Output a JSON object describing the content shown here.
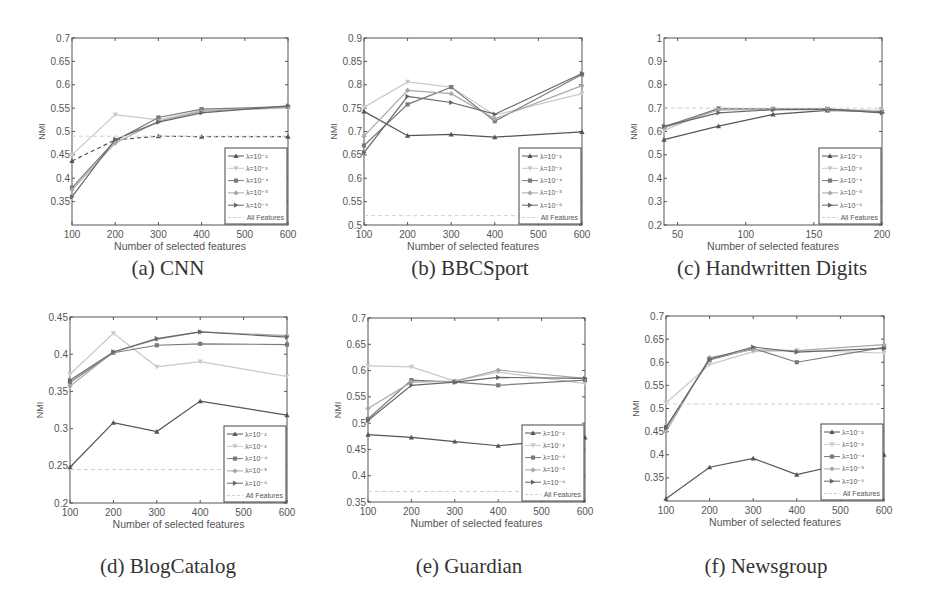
{
  "figure": {
    "captions": [
      "(a) CNN",
      "(b) BBCSport",
      "(c) Handwritten Digits",
      "(d) BlogCatalog",
      "(e) Guardian",
      "(f) Newsgroup"
    ]
  },
  "legend": {
    "entries": [
      "λ=10⁻²",
      "λ=10⁻³",
      "λ=10⁻⁴",
      "λ=10⁻⁵",
      "λ=10⁻⁶",
      "All Features"
    ],
    "colors": [
      "#555555",
      "#c8c8c8",
      "#7a7a7a",
      "#a8a8a8",
      "#666666",
      "#d0d0d0"
    ],
    "markers": [
      "triangle",
      "triangle-down",
      "square",
      "diamond",
      "triangle-right",
      "none"
    ]
  },
  "chart_data": [
    {
      "type": "line",
      "title": "(a) CNN",
      "xlabel": "Number of selected features",
      "ylabel": "NMI",
      "x": [
        100,
        200,
        300,
        400,
        600
      ],
      "xticks": [
        100,
        200,
        300,
        400,
        500,
        600
      ],
      "xlim": [
        100,
        600
      ],
      "ylim": [
        0.3,
        0.7
      ],
      "yticks": [
        0.35,
        0.4,
        0.45,
        0.5,
        0.55,
        0.6,
        0.65,
        0.7
      ],
      "grid": false,
      "legend_position": "lower right",
      "series": [
        {
          "name": "λ=10⁻²",
          "values": [
            0.437,
            0.482,
            0.49,
            0.489,
            0.489
          ]
        },
        {
          "name": "λ=10⁻³",
          "values": [
            0.45,
            0.536,
            0.525,
            0.545,
            0.55
          ]
        },
        {
          "name": "λ=10⁻⁴",
          "values": [
            0.38,
            0.48,
            0.53,
            0.548,
            0.553
          ]
        },
        {
          "name": "λ=10⁻⁵",
          "values": [
            0.375,
            0.475,
            0.522,
            0.543,
            0.552
          ]
        },
        {
          "name": "λ=10⁻⁶",
          "values": [
            0.36,
            0.483,
            0.52,
            0.54,
            0.555
          ]
        },
        {
          "name": "All Features",
          "values": [
            0.49,
            0.49,
            0.49,
            0.49,
            0.49
          ]
        }
      ]
    },
    {
      "type": "line",
      "title": "(b) BBCSport",
      "xlabel": "Number of selected features",
      "ylabel": "NMI",
      "x": [
        100,
        200,
        300,
        400,
        600
      ],
      "xticks": [
        100,
        200,
        300,
        400,
        500,
        600
      ],
      "xlim": [
        100,
        600
      ],
      "ylim": [
        0.5,
        0.9
      ],
      "yticks": [
        0.5,
        0.55,
        0.6,
        0.65,
        0.7,
        0.75,
        0.8,
        0.85,
        0.9
      ],
      "grid": false,
      "legend_position": "lower right",
      "series": [
        {
          "name": "λ=10⁻²",
          "values": [
            0.743,
            0.691,
            0.694,
            0.688,
            0.699
          ]
        },
        {
          "name": "λ=10⁻³",
          "values": [
            0.752,
            0.806,
            0.795,
            0.735,
            0.781
          ]
        },
        {
          "name": "λ=10⁻⁴",
          "values": [
            0.67,
            0.758,
            0.795,
            0.722,
            0.822
          ]
        },
        {
          "name": "λ=10⁻⁵",
          "values": [
            0.69,
            0.788,
            0.781,
            0.727,
            0.798
          ]
        },
        {
          "name": "λ=10⁻⁶",
          "values": [
            0.655,
            0.775,
            0.762,
            0.737,
            0.824
          ]
        },
        {
          "name": "All Features",
          "values": [
            0.52,
            0.52,
            0.52,
            0.52,
            0.52
          ]
        }
      ]
    },
    {
      "type": "line",
      "title": "(c) Handwritten Digits",
      "xlabel": "Number of selected features",
      "ylabel": "NMI",
      "x": [
        40,
        80,
        120,
        160,
        200
      ],
      "xticks": [
        50,
        100,
        150,
        200
      ],
      "xlim": [
        40,
        200
      ],
      "ylim": [
        0.2,
        1.0
      ],
      "yticks": [
        0.2,
        0.3,
        0.4,
        0.5,
        0.6,
        0.7,
        0.8,
        0.9,
        1
      ],
      "grid": false,
      "legend_position": "lower right",
      "series": [
        {
          "name": "λ=10⁻²",
          "values": [
            0.565,
            0.623,
            0.673,
            0.69,
            0.685
          ]
        },
        {
          "name": "λ=10⁻³",
          "values": [
            0.605,
            0.7,
            0.695,
            0.694,
            0.69
          ]
        },
        {
          "name": "λ=10⁻⁴",
          "values": [
            0.62,
            0.698,
            0.697,
            0.697,
            0.683
          ]
        },
        {
          "name": "λ=10⁻⁵",
          "values": [
            0.615,
            0.692,
            0.694,
            0.695,
            0.681
          ]
        },
        {
          "name": "λ=10⁻⁶",
          "values": [
            0.622,
            0.68,
            0.693,
            0.696,
            0.68
          ]
        },
        {
          "name": "All Features",
          "values": [
            0.7,
            0.7,
            0.7,
            0.7,
            0.7
          ]
        }
      ]
    },
    {
      "type": "line",
      "title": "(d) BlogCatalog",
      "xlabel": "Number of selected features",
      "ylabel": "NMI",
      "x": [
        100,
        200,
        300,
        400,
        600
      ],
      "xticks": [
        100,
        200,
        300,
        400,
        500,
        600
      ],
      "xlim": [
        100,
        600
      ],
      "ylim": [
        0.2,
        0.45
      ],
      "yticks": [
        0.2,
        0.25,
        0.3,
        0.35,
        0.4,
        0.45
      ],
      "grid": false,
      "legend_position": "lower right",
      "series": [
        {
          "name": "λ=10⁻²",
          "values": [
            0.248,
            0.308,
            0.296,
            0.337,
            0.318
          ]
        },
        {
          "name": "λ=10⁻³",
          "values": [
            0.373,
            0.428,
            0.383,
            0.39,
            0.37
          ]
        },
        {
          "name": "λ=10⁻⁴",
          "values": [
            0.362,
            0.402,
            0.412,
            0.414,
            0.413
          ]
        },
        {
          "name": "λ=10⁻⁵",
          "values": [
            0.357,
            0.403,
            0.42,
            0.43,
            0.425
          ]
        },
        {
          "name": "λ=10⁻⁶",
          "values": [
            0.365,
            0.403,
            0.421,
            0.43,
            0.423
          ]
        },
        {
          "name": "All Features",
          "values": [
            0.245,
            0.245,
            0.245,
            0.245,
            0.245
          ]
        }
      ]
    },
    {
      "type": "line",
      "title": "(e) Guardian",
      "xlabel": "Number of selected features",
      "ylabel": "NMI",
      "x": [
        100,
        200,
        300,
        400,
        600
      ],
      "xticks": [
        100,
        200,
        300,
        400,
        500,
        600
      ],
      "xlim": [
        100,
        600
      ],
      "ylim": [
        0.35,
        0.7
      ],
      "yticks": [
        0.35,
        0.4,
        0.45,
        0.5,
        0.55,
        0.6,
        0.65,
        0.7
      ],
      "grid": false,
      "legend_position": "lower right",
      "series": [
        {
          "name": "λ=10⁻²",
          "values": [
            0.478,
            0.473,
            0.465,
            0.457,
            0.473
          ]
        },
        {
          "name": "λ=10⁻³",
          "values": [
            0.609,
            0.607,
            0.58,
            0.597,
            0.575
          ]
        },
        {
          "name": "λ=10⁻⁴",
          "values": [
            0.508,
            0.582,
            0.578,
            0.572,
            0.582
          ]
        },
        {
          "name": "λ=10⁻⁵",
          "values": [
            0.528,
            0.578,
            0.58,
            0.601,
            0.585
          ]
        },
        {
          "name": "λ=10⁻⁶",
          "values": [
            0.505,
            0.572,
            0.578,
            0.587,
            0.585
          ]
        },
        {
          "name": "All Features",
          "values": [
            0.37,
            0.37,
            0.37,
            0.37,
            0.37
          ]
        }
      ]
    },
    {
      "type": "line",
      "title": "(f) Newsgroup",
      "xlabel": "Number of selected features",
      "ylabel": "NMI",
      "x": [
        100,
        200,
        300,
        400,
        600
      ],
      "xticks": [
        100,
        200,
        300,
        400,
        500,
        600
      ],
      "xlim": [
        100,
        600
      ],
      "ylim": [
        0.3,
        0.7
      ],
      "yticks": [
        0.35,
        0.4,
        0.45,
        0.5,
        0.55,
        0.6,
        0.65,
        0.7
      ],
      "grid": false,
      "legend_position": "lower right",
      "series": [
        {
          "name": "λ=10⁻²",
          "values": [
            0.305,
            0.373,
            0.392,
            0.357,
            0.4
          ]
        },
        {
          "name": "λ=10⁻³",
          "values": [
            0.512,
            0.595,
            0.623,
            0.625,
            0.62
          ]
        },
        {
          "name": "λ=10⁻⁴",
          "values": [
            0.46,
            0.605,
            0.63,
            0.6,
            0.632
          ]
        },
        {
          "name": "λ=10⁻⁵",
          "values": [
            0.45,
            0.61,
            0.627,
            0.625,
            0.638
          ]
        },
        {
          "name": "λ=10⁻⁶",
          "values": [
            0.458,
            0.607,
            0.633,
            0.622,
            0.63
          ]
        },
        {
          "name": "All Features",
          "values": [
            0.51,
            0.51,
            0.51,
            0.51,
            0.51
          ]
        }
      ]
    }
  ]
}
